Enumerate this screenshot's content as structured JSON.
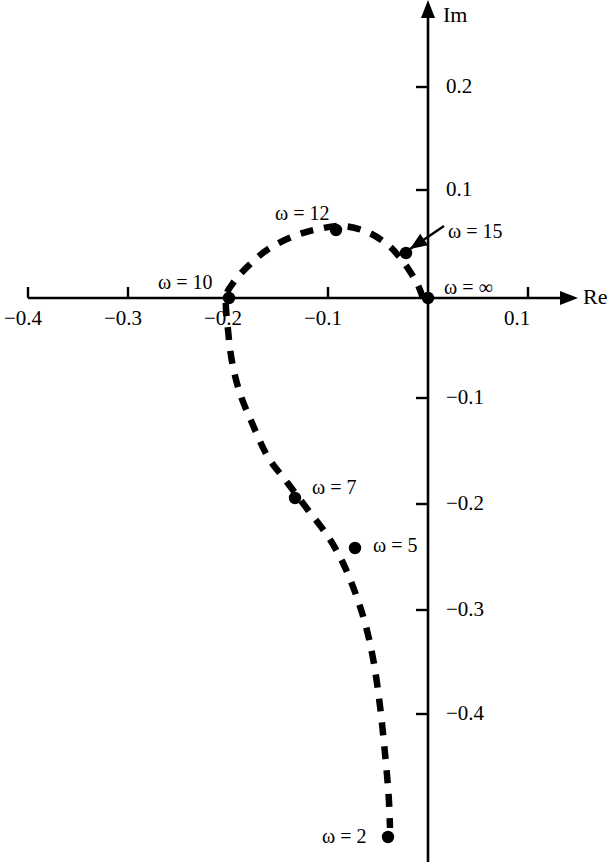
{
  "figure": {
    "type": "nyquist-plot",
    "background": "#ffffff",
    "ink_color": "#000000"
  },
  "axes": {
    "x_axis_label": "Re",
    "y_axis_label": "Im",
    "x_ticks": [
      {
        "value": -0.4,
        "label": "−0.4",
        "px": 28
      },
      {
        "value": -0.3,
        "label": "−0.3",
        "px": 128
      },
      {
        "value": -0.2,
        "label": "−0.2",
        "px": 228
      },
      {
        "value": -0.1,
        "label": "−0.1",
        "px": 328
      },
      {
        "value": 0.1,
        "label": "0.1",
        "px": 528
      }
    ],
    "y_ticks": [
      {
        "value": 0.2,
        "label": "0.2",
        "px": 87
      },
      {
        "value": 0.1,
        "label": "0.1",
        "px": 190
      },
      {
        "value": -0.1,
        "label": "−0.1",
        "px": 398
      },
      {
        "value": -0.2,
        "label": "−0.2",
        "px": 504
      },
      {
        "value": -0.3,
        "label": "−0.3",
        "px": 610
      },
      {
        "value": -0.4,
        "label": "−0.4",
        "px": 714
      }
    ],
    "origin_px": {
      "x": 428,
      "y": 298
    },
    "x_range": [
      -0.45,
      0.12
    ],
    "y_range": [
      -0.47,
      0.28
    ]
  },
  "chart_data": {
    "type": "line",
    "title": "",
    "subtitle": "",
    "xlabel": "Re",
    "ylabel": "Im",
    "xlim": [
      -0.45,
      0.12
    ],
    "ylim": [
      -0.47,
      0.28
    ],
    "grid": false,
    "legend": "none",
    "line_style": "dashed",
    "series": [
      {
        "name": "Nyquist locus",
        "x": [
          -0.005,
          -0.01,
          -0.018,
          -0.028,
          -0.04,
          -0.06,
          -0.085,
          -0.11,
          -0.135,
          -0.16,
          -0.18,
          -0.195,
          -0.202,
          -0.2,
          -0.196,
          -0.188,
          -0.175,
          -0.16,
          -0.14,
          -0.12,
          -0.1,
          -0.085,
          -0.072,
          -0.062,
          -0.054,
          -0.048,
          -0.044,
          -0.041,
          -0.039,
          -0.038
        ],
        "y": [
          0.0,
          0.012,
          0.025,
          0.038,
          0.05,
          0.062,
          0.068,
          0.065,
          0.058,
          0.046,
          0.03,
          0.014,
          0.0,
          -0.03,
          -0.06,
          -0.09,
          -0.12,
          -0.15,
          -0.175,
          -0.2,
          -0.225,
          -0.25,
          -0.28,
          -0.31,
          -0.345,
          -0.385,
          -0.42,
          -0.45,
          -0.475,
          -0.5
        ]
      }
    ],
    "marked_points": [
      {
        "label": "ω = ∞",
        "omega": "infinity",
        "re": 0.0,
        "im": 0.0,
        "px": {
          "x": 428,
          "y": 298
        },
        "label_px": {
          "x": 444,
          "y": 277
        },
        "has_arrow": false
      },
      {
        "label": "ω = 15",
        "omega": 15,
        "re": -0.038,
        "im": 0.042,
        "px": {
          "x": 406,
          "y": 253
        },
        "label_px": {
          "x": 448,
          "y": 221
        },
        "has_arrow": true
      },
      {
        "label": "ω = 12",
        "omega": 12,
        "re": -0.092,
        "im": 0.064,
        "px": {
          "x": 336,
          "y": 230
        },
        "label_px": {
          "x": 275,
          "y": 203
        },
        "has_arrow": false
      },
      {
        "label": "ω = 10",
        "omega": 10,
        "re": -0.199,
        "im": 0.0,
        "px": {
          "x": 229,
          "y": 298
        },
        "label_px": {
          "x": 158,
          "y": 272
        },
        "has_arrow": false
      },
      {
        "label": "ω = 7",
        "omega": 7,
        "re": -0.133,
        "im": -0.189,
        "px": {
          "x": 295,
          "y": 498
        },
        "label_px": {
          "x": 312,
          "y": 477
        },
        "has_arrow": false
      },
      {
        "label": "ω = 5",
        "omega": 5,
        "re": -0.073,
        "im": -0.236,
        "px": {
          "x": 355,
          "y": 548
        },
        "label_px": {
          "x": 373,
          "y": 535
        },
        "has_arrow": false
      },
      {
        "label": "ω = 2",
        "omega": 2,
        "re": -0.038,
        "im": -0.509,
        "px": {
          "x": 388,
          "y": 837
        },
        "label_px": {
          "x": 322,
          "y": 826
        },
        "has_arrow": false
      }
    ],
    "annotation_arrow": {
      "from_px": {
        "x": 444,
        "y": 226
      },
      "to_px": {
        "x": 410,
        "y": 249
      },
      "points_to": "ω = 15"
    }
  }
}
